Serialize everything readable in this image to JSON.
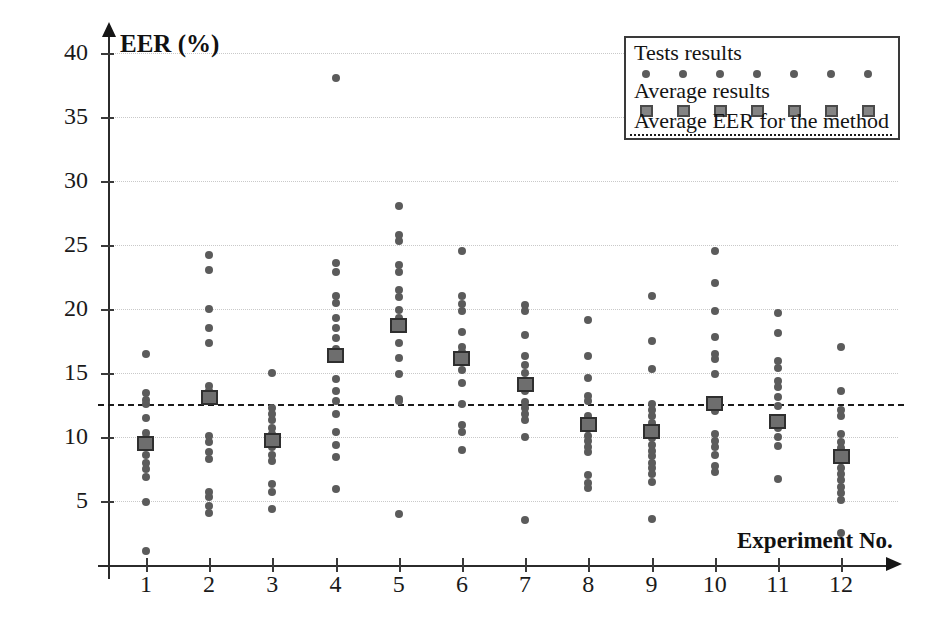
{
  "chart_data": {
    "type": "scatter",
    "title": "",
    "xlabel": "Experiment No.",
    "ylabel": "EER (%)",
    "xlim": [
      0.4,
      12.9
    ],
    "ylim": [
      0,
      41
    ],
    "ytick_labels": [
      "5",
      "10",
      "15",
      "20",
      "25",
      "30",
      "35",
      "40"
    ],
    "ytick_values": [
      5,
      10,
      15,
      20,
      25,
      30,
      35,
      40
    ],
    "xtick_labels": [
      "1",
      "2",
      "3",
      "4",
      "5",
      "6",
      "7",
      "8",
      "9",
      "10",
      "11",
      "12"
    ],
    "xtick_values": [
      1,
      2,
      3,
      4,
      5,
      6,
      7,
      8,
      9,
      10,
      11,
      12
    ],
    "grid": true,
    "legend_position": "top-right",
    "average_eer_for_method": 12.6,
    "series": [
      {
        "name": "Tests results",
        "marker": "dot",
        "color": "#5b5b5b",
        "points": [
          {
            "x": 1,
            "values": [
              16.5,
              13.4,
              12.9,
              12.6,
              11.5,
              10.3,
              9.9,
              9.5,
              8.6,
              8.0,
              7.5,
              6.9,
              4.9,
              1.1
            ]
          },
          {
            "x": 2,
            "values": [
              24.2,
              23.0,
              20.0,
              18.5,
              17.3,
              14.0,
              13.6,
              13.2,
              12.8,
              10.1,
              9.6,
              8.8,
              8.3,
              5.7,
              5.3,
              4.6,
              4.1
            ]
          },
          {
            "x": 3,
            "values": [
              15.0,
              12.3,
              11.8,
              11.3,
              10.7,
              10.2,
              9.7,
              9.2,
              8.6,
              8.1,
              6.3,
              5.7,
              4.4
            ]
          },
          {
            "x": 4,
            "values": [
              38.0,
              23.6,
              22.9,
              21.0,
              20.5,
              19.3,
              18.5,
              17.7,
              16.9,
              16.4,
              14.5,
              13.6,
              12.8,
              11.8,
              10.4,
              9.4,
              8.4,
              5.9
            ]
          },
          {
            "x": 5,
            "values": [
              28.0,
              25.8,
              25.3,
              23.4,
              22.9,
              21.5,
              20.9,
              19.9,
              19.3,
              18.5,
              17.3,
              16.2,
              14.9,
              13.0,
              12.8,
              4.0
            ]
          },
          {
            "x": 6,
            "values": [
              24.5,
              21.0,
              20.4,
              19.8,
              18.2,
              17.0,
              16.6,
              16.1,
              15.2,
              14.2,
              12.6,
              10.9,
              10.4,
              9.0
            ]
          },
          {
            "x": 7,
            "values": [
              20.3,
              19.8,
              18.0,
              16.3,
              15.6,
              15.0,
              14.4,
              13.6,
              12.7,
              12.3,
              11.8,
              11.3,
              10.0,
              3.5
            ]
          },
          {
            "x": 8,
            "values": [
              19.1,
              16.3,
              14.6,
              13.2,
              12.8,
              11.6,
              11.1,
              10.6,
              10.1,
              9.7,
              9.2,
              8.8,
              7.0,
              6.4,
              6.0
            ]
          },
          {
            "x": 9,
            "values": [
              21.0,
              17.5,
              15.3,
              12.6,
              12.1,
              11.6,
              11.1,
              10.7,
              10.3,
              9.9,
              9.4,
              8.9,
              8.5,
              8.0,
              7.6,
              7.1,
              6.5,
              3.6
            ]
          },
          {
            "x": 10,
            "values": [
              24.5,
              22.0,
              19.8,
              17.8,
              16.5,
              16.1,
              14.9,
              12.7,
              12.0,
              10.2,
              9.7,
              9.2,
              8.6,
              7.7,
              7.3
            ]
          },
          {
            "x": 11,
            "values": [
              19.7,
              18.1,
              15.9,
              15.4,
              14.4,
              13.9,
              13.1,
              12.4,
              11.3,
              10.7,
              10.0,
              9.3,
              6.7
            ]
          },
          {
            "x": 12,
            "values": [
              17.0,
              13.6,
              12.1,
              11.6,
              10.2,
              9.6,
              9.1,
              8.6,
              8.1,
              7.6,
              7.1,
              6.6,
              6.1,
              5.6,
              5.1,
              2.5
            ]
          }
        ]
      },
      {
        "name": "Average results",
        "marker": "square",
        "color": "#6e6e6e",
        "values": [
          9.5,
          13.1,
          9.7,
          16.4,
          18.7,
          16.1,
          14.1,
          11.0,
          10.4,
          12.6,
          11.2,
          8.5
        ]
      }
    ]
  },
  "axes": {
    "y_title": "EER (%)",
    "x_title": "Experiment No."
  },
  "legend": {
    "items": [
      {
        "label": "Tests results",
        "marker": "dot"
      },
      {
        "label": "Average results",
        "marker": "square"
      },
      {
        "label": "Average EER for the method",
        "marker": "dashed-line"
      }
    ]
  },
  "colors": {
    "dot": "#5b5b5b",
    "square_fill": "#6e6e6e",
    "square_border": "#2f2f2f",
    "axis": "#2b2b2b",
    "grid": "#c9c9c9",
    "avg_line": "#1b1b1b",
    "background": "#ffffff"
  }
}
